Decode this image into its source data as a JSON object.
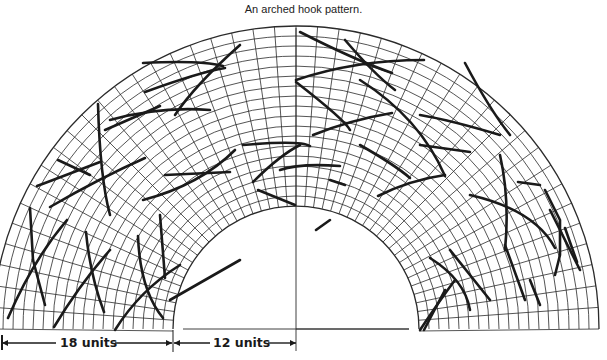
{
  "caption": "An arched hook pattern.",
  "colors": {
    "ink": "#1a1a1a",
    "grid": "#2a2a2a",
    "background": "#ffffff"
  },
  "geometry": {
    "center_x": 296,
    "baseline_y": 329,
    "inner_radius": 123,
    "outer_radius": 303,
    "ring_count": 18,
    "radial_count": 44
  },
  "dimensions": {
    "left_label": "18 units",
    "right_label": "12 units"
  },
  "hooks": [
    [
      [
        8,
        318
      ],
      [
        33,
        260
      ],
      [
        67,
        220
      ]
    ],
    [
      [
        33,
        260
      ],
      [
        45,
        305
      ]
    ],
    [
      [
        30,
        208
      ],
      [
        33,
        260
      ]
    ],
    [
      [
        54,
        327
      ],
      [
        80,
        284
      ],
      [
        110,
        250
      ]
    ],
    [
      [
        86,
        232
      ],
      [
        90,
        275
      ],
      [
        104,
        312
      ]
    ],
    [
      [
        115,
        330
      ],
      [
        140,
        290
      ],
      [
        180,
        265
      ]
    ],
    [
      [
        138,
        236
      ],
      [
        140,
        290
      ],
      [
        163,
        318
      ]
    ],
    [
      [
        160,
        215
      ],
      [
        165,
        278
      ]
    ],
    [
      [
        50,
        207
      ],
      [
        100,
        178
      ],
      [
        145,
        158
      ]
    ],
    [
      [
        58,
        160
      ],
      [
        90,
        175
      ]
    ],
    [
      [
        37,
        186
      ],
      [
        48,
        182
      ],
      [
        100,
        162
      ]
    ],
    [
      [
        98,
        104
      ],
      [
        100,
        178
      ],
      [
        110,
        215
      ]
    ],
    [
      [
        110,
        120
      ],
      [
        160,
        106
      ],
      [
        210,
        110
      ]
    ],
    [
      [
        175,
        115
      ],
      [
        195,
        85
      ],
      [
        240,
        45
      ]
    ],
    [
      [
        105,
        130
      ],
      [
        160,
        106
      ]
    ],
    [
      [
        143,
        200
      ],
      [
        200,
        185
      ],
      [
        235,
        150
      ]
    ],
    [
      [
        165,
        175
      ],
      [
        230,
        172
      ]
    ],
    [
      [
        145,
        92
      ],
      [
        200,
        72
      ],
      [
        225,
        68
      ]
    ],
    [
      [
        143,
        63
      ],
      [
        200,
        60
      ],
      [
        223,
        66
      ]
    ],
    [
      [
        170,
        300
      ],
      [
        240,
        260
      ]
    ],
    [
      [
        243,
        145
      ],
      [
        300,
        140
      ],
      [
        310,
        146
      ]
    ],
    [
      [
        280,
        170
      ],
      [
        300,
        163
      ],
      [
        340,
        166
      ]
    ],
    [
      [
        300,
        32
      ],
      [
        355,
        60
      ],
      [
        392,
        73
      ]
    ],
    [
      [
        296,
        80
      ],
      [
        355,
        60
      ],
      [
        424,
        60
      ]
    ],
    [
      [
        296,
        82
      ],
      [
        345,
        120
      ],
      [
        350,
        130
      ]
    ],
    [
      [
        313,
        135
      ],
      [
        350,
        120
      ],
      [
        392,
        113
      ]
    ],
    [
      [
        360,
        80
      ],
      [
        420,
        118
      ],
      [
        445,
        176
      ]
    ],
    [
      [
        420,
        115
      ],
      [
        450,
        120
      ],
      [
        500,
        135
      ]
    ],
    [
      [
        360,
        145
      ],
      [
        395,
        165
      ],
      [
        410,
        178
      ]
    ],
    [
      [
        253,
        182
      ],
      [
        280,
        155
      ],
      [
        300,
        145
      ]
    ],
    [
      [
        258,
        190
      ],
      [
        295,
        205
      ]
    ],
    [
      [
        378,
        196
      ],
      [
        410,
        180
      ],
      [
        445,
        175
      ]
    ],
    [
      [
        420,
        145
      ],
      [
        470,
        152
      ]
    ],
    [
      [
        465,
        63
      ],
      [
        490,
        110
      ],
      [
        510,
        135
      ]
    ],
    [
      [
        470,
        195
      ],
      [
        535,
        210
      ],
      [
        555,
        248
      ]
    ],
    [
      [
        500,
        155
      ],
      [
        510,
        200
      ],
      [
        505,
        250
      ]
    ],
    [
      [
        518,
        182
      ],
      [
        540,
        185
      ]
    ],
    [
      [
        545,
        190
      ],
      [
        560,
        220
      ],
      [
        560,
        255
      ],
      [
        555,
        275
      ]
    ],
    [
      [
        550,
        210
      ],
      [
        580,
        270
      ]
    ],
    [
      [
        430,
        258
      ],
      [
        465,
        280
      ],
      [
        470,
        310
      ]
    ],
    [
      [
        420,
        330
      ],
      [
        440,
        300
      ],
      [
        455,
        280
      ]
    ],
    [
      [
        424,
        330
      ],
      [
        445,
        290
      ]
    ],
    [
      [
        450,
        250
      ],
      [
        490,
        300
      ]
    ],
    [
      [
        505,
        245
      ],
      [
        525,
        300
      ]
    ],
    [
      [
        565,
        228
      ],
      [
        577,
        262
      ]
    ],
    [
      [
        530,
        280
      ],
      [
        540,
        305
      ]
    ],
    [
      [
        345,
        40
      ],
      [
        375,
        75
      ],
      [
        395,
        90
      ]
    ],
    [
      [
        330,
        180
      ],
      [
        345,
        185
      ]
    ],
    [
      [
        316,
        230
      ],
      [
        330,
        220
      ]
    ]
  ]
}
